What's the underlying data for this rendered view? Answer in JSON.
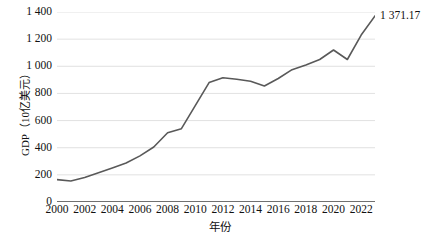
{
  "chart_data": {
    "type": "line",
    "title": "",
    "subtitle": "",
    "xlabel": "年份",
    "ylabel": "GDP（10亿美元）",
    "xlim": [
      2000,
      2023
    ],
    "ylim": [
      0,
      1400
    ],
    "grid": "horizontal",
    "legend": "none",
    "x": [
      2000,
      2001,
      2002,
      2003,
      2004,
      2005,
      2006,
      2007,
      2008,
      2009,
      2010,
      2011,
      2012,
      2013,
      2014,
      2015,
      2016,
      2017,
      2018,
      2019,
      2020,
      2021,
      2022,
      2023
    ],
    "values": [
      165,
      155,
      180,
      215,
      250,
      287,
      340,
      405,
      510,
      540,
      710,
      880,
      915,
      905,
      890,
      855,
      910,
      975,
      1010,
      1050,
      1120,
      1050,
      1230,
      1371.17
    ],
    "x_tick_labels": [
      "2000",
      "2002",
      "2004",
      "2006",
      "2008",
      "2010",
      "2012",
      "2014",
      "2016",
      "2018",
      "2020",
      "2022"
    ],
    "x_tick_values": [
      2000,
      2002,
      2004,
      2006,
      2008,
      2010,
      2012,
      2014,
      2016,
      2018,
      2020,
      2022
    ],
    "y_tick_labels": [
      "0",
      "200",
      "400",
      "600",
      "800",
      "1 000",
      "1 200",
      "1 400"
    ],
    "y_tick_values": [
      0,
      200,
      400,
      600,
      800,
      1000,
      1200,
      1400
    ],
    "annotations": [
      {
        "name": "last-point-value",
        "text": "1 371.17",
        "x": 2023,
        "y": 1371.17
      }
    ],
    "series_color": "#595959",
    "grid_color": "#d9d9d9",
    "axis_color": "#404040",
    "background_color": "#ffffff"
  }
}
